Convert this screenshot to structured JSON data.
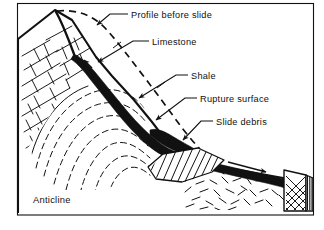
{
  "figure": {
    "kind": "geologic-block-diagram",
    "frame": {
      "stroke": "#111111",
      "fill": "#ffffff"
    },
    "ink_color": "#111111",
    "paper_color": "#ffffff"
  },
  "labels": {
    "profile_before_slide": "Profile before slide",
    "limestone": "Limestone",
    "shale": "Shale",
    "rupture_surface": "Rupture surface",
    "slide_debris": "Slide debris",
    "anticline": "Anticline"
  },
  "annotations": [
    {
      "id": "profile-before-slide",
      "text": "Profile before slide",
      "text_x": 131,
      "text_y": 17,
      "leader": "M 127 14 L 110 14 L 95 26",
      "arrow_at": [
        95,
        26
      ],
      "arrow_angle": 142
    },
    {
      "id": "limestone",
      "text": "Limestone",
      "text_x": 152,
      "text_y": 44,
      "leader": "M 148 41 L 133 41 L 95 63",
      "arrow_at": [
        95,
        63
      ],
      "arrow_angle": 150
    },
    {
      "id": "shale",
      "text": "Shale",
      "text_x": 191,
      "text_y": 78,
      "leader": "M 187 75 L 175 75 L 135 99",
      "arrow_at": [
        135,
        99
      ],
      "arrow_angle": 150
    },
    {
      "id": "rupture-surface",
      "text": "Rupture surface",
      "text_x": 200,
      "text_y": 101,
      "leader": "M 196 98 L 184 98 L 152 121",
      "arrow_at": [
        152,
        121
      ],
      "arrow_angle": 145
    },
    {
      "id": "slide-debris",
      "text": "Slide debris",
      "text_x": 216,
      "text_y": 124,
      "leader": "M 212 121 L 200 121 L 178 142",
      "arrow_at": [
        178,
        142
      ],
      "arrow_angle": 137
    },
    {
      "id": "anticline",
      "text": "Anticline",
      "text_x": 33,
      "text_y": 203,
      "leader": "",
      "arrow_at": null,
      "arrow_angle": 0
    }
  ],
  "geology": {
    "units": [
      {
        "name": "limestone",
        "pattern": "joint-blocks",
        "note": "upper-left jointed block"
      },
      {
        "name": "shale",
        "pattern": "solid-black",
        "note": "dark band along rupture surface"
      },
      {
        "name": "anticline-beds",
        "pattern": "nested-arcs",
        "note": "folded beds in core"
      },
      {
        "name": "slide-debris",
        "pattern": "diagonal-hatch",
        "note": "hatched wedge"
      },
      {
        "name": "scattered-rubble",
        "pattern": "random-dashes",
        "note": "loose blocks on apron"
      },
      {
        "name": "cross-hatch-block",
        "pattern": "diamond-mesh",
        "note": "right-hand mesh block"
      },
      {
        "name": "vertical-block",
        "pattern": "vertical-lines",
        "note": "far right block"
      }
    ],
    "movement_arrow": {
      "from": [
        228,
        162
      ],
      "to": [
        268,
        174
      ],
      "label": ""
    },
    "profile_line_style": "dashed"
  }
}
